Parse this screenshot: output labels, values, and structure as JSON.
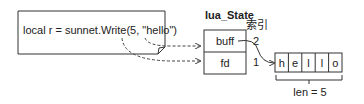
{
  "code_box": {
    "text": "local r = sunnet.Write(5, \"hello\")"
  },
  "lua_state": {
    "title": "lua_State",
    "index_label": "索引",
    "slots": [
      {
        "label": "buff",
        "index": "2"
      },
      {
        "label": "fd",
        "index": "1"
      }
    ]
  },
  "buffer": {
    "chars": [
      "h",
      "e",
      "l",
      "l",
      "o"
    ],
    "length_label": "len = 5"
  }
}
